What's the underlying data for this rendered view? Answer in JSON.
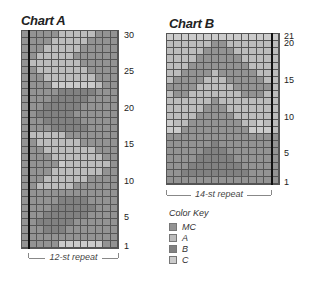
{
  "chart_a": {
    "title": "Chart A",
    "cols": 13,
    "rows": 30,
    "row_labels": [
      "30",
      "25",
      "20",
      "15",
      "10",
      "5",
      "1"
    ],
    "repeat_label": "12-st repeat",
    "pattern": [
      "MMMMMAAAAAMMM",
      "MMMMAAAAAMMMM",
      "MMMAAAAAMMMMM",
      "MMAAAAAMMMMMM",
      "MAAAAAAAMMMMM",
      "MMAAAAAAAMMMM",
      "MMMAAAAAAAMMM",
      "MMMMCCCCCCAMM",
      "MMMMMBBBBBMMM",
      "MMMMBBBBBMMMM",
      "MMMBBBBBMMMMM",
      "MMBBBBBMMMMMM",
      "MMMBBBBBMMMMM",
      "MMMMBBBBBMMMM",
      "MAAAAAMMMMMMM",
      "MMAAAAAAMMMMM",
      "MMMAAAAAAAMMM",
      "MMMMAAAAAAAMM",
      "MMMMMCAAAAAAM",
      "MMMMAAAAAAAMM",
      "MMMAAAAAAMMMM",
      "MMAAAAAMMMMMM",
      "MMMMMMMMMMMMM",
      "MMMMMBBBBMMMM",
      "MMMMBBBBBBMMM",
      "MMMBBBBBBMMMM",
      "MMBBBBBMMMMMM",
      "MMMBBBMMMMMMM",
      "MMMMMMMMMMMMM",
      "MMMMMCCCCCCMM"
    ]
  },
  "chart_b": {
    "title": "Chart B",
    "cols": 15,
    "rows": 21,
    "row_labels": [
      "21",
      "20",
      "15",
      "10",
      "5",
      "1"
    ],
    "repeat_label": "14-st repeat",
    "pattern": [
      "CCCCCCCCCCCCCCC",
      "AAAAAAMMAAAAAAA",
      "AAAAAMMMMAAAAAA",
      "AAAAMMMMMMAAAAA",
      "AAAMMMMMMMMAAAA",
      "AAMMMMAMMMMMAAA",
      "AMMMMAAAMMMMMAA",
      "MMMMAAAAAMMMMMA",
      "AMMAAAAAAAMMMAA",
      "AAAAAAMAAAAAAAA",
      "AAAAAMMMAAAAAAA",
      "AAAAMMMMMAAAAAA",
      "CAAMMMMMMMAACAA",
      "CCMMMMMMMMMCCCA",
      "MMMMMMMMMMMMMMM",
      "MMMMMMBMMMMMMMM",
      "MMMMMBBBMMMMMMM",
      "MMMMBBBBBMMMMMM",
      "MMMBBBBBBBMMMMM",
      "MMBBBBBBBBBMMMM",
      "MMMMMMMMMMMMMMM"
    ]
  },
  "color_key": {
    "title": "Color Key",
    "items": [
      {
        "code": "M",
        "label": "MC",
        "color": "#939393"
      },
      {
        "code": "A",
        "label": "A",
        "color": "#bcbcbc"
      },
      {
        "code": "B",
        "label": "B",
        "color": "#818181"
      },
      {
        "code": "C",
        "label": "C",
        "color": "#cbcbcb"
      }
    ]
  }
}
